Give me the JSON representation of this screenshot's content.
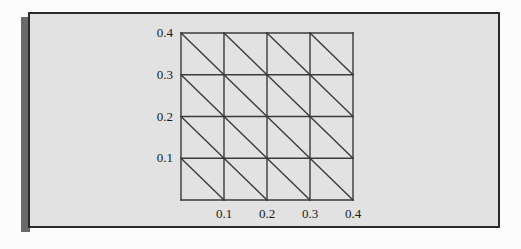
{
  "figure": {
    "panel_background": "#e2e2e2",
    "panel_border_color": "#2b2b2b",
    "shadow_color": "#6a6a6a",
    "page_background": "#fcfcfc",
    "line_color": "#3a3a3a"
  },
  "chart_data": {
    "type": "diagram",
    "subtype": "triangular-mesh",
    "title": "",
    "xlabel": "",
    "ylabel": "",
    "xlim": [
      0.0,
      0.4
    ],
    "ylim": [
      0.0,
      0.4
    ],
    "grid": true,
    "legend": null,
    "x_ticks": [
      0.1,
      0.2,
      0.3,
      0.4
    ],
    "y_ticks": [
      0.1,
      0.2,
      0.3,
      0.4
    ],
    "x_tick_labels": [
      "0.1",
      "0.2",
      "0.3",
      "0.4"
    ],
    "y_tick_labels": [
      "0.1",
      "0.2",
      "0.3",
      "0.4"
    ],
    "mesh": {
      "columns": 4,
      "rows": 4,
      "cell_size": 0.1,
      "cells": 16,
      "triangles": 32,
      "diagonal_direction": "top-left-to-bottom-right",
      "x_gridlines": [
        0.0,
        0.1,
        0.2,
        0.3,
        0.4
      ],
      "y_gridlines": [
        0.0,
        0.1,
        0.2,
        0.3,
        0.4
      ]
    },
    "geometry": {
      "left_px": 181,
      "top_px": 33,
      "right_px": 353,
      "bottom_px": 200
    }
  }
}
